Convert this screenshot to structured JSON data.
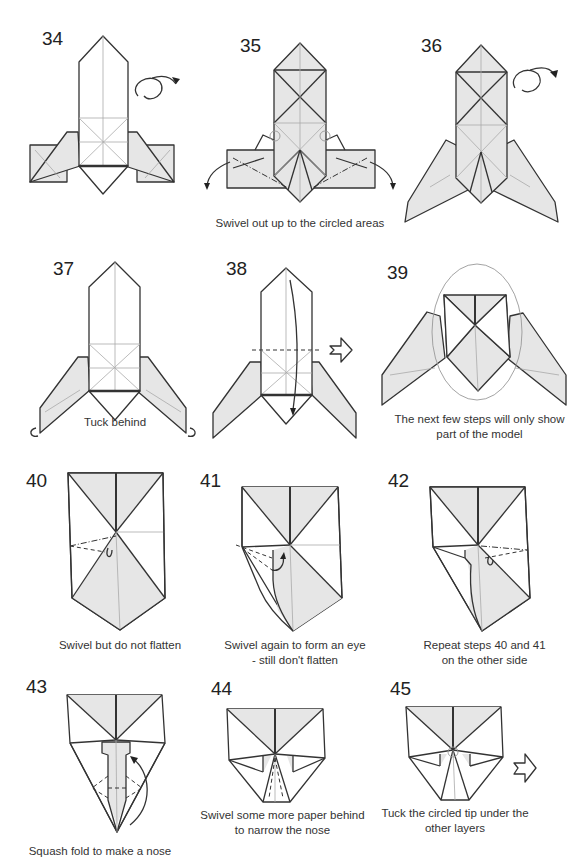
{
  "colors": {
    "line": "#333333",
    "crease": "#aaaaaa",
    "shade": "#e6e6e6",
    "paper": "#ffffff",
    "oval": "#999999"
  },
  "steps": [
    {
      "number": "34",
      "caption": "",
      "icons": [
        "turn-over-icon"
      ]
    },
    {
      "number": "35",
      "caption": "Swivel out up to the circled areas",
      "icons": [
        "swivel-arrow-icon",
        "circle-marker-icon"
      ]
    },
    {
      "number": "36",
      "caption": "",
      "icons": [
        "turn-over-icon"
      ]
    },
    {
      "number": "37",
      "caption": "Tuck behind",
      "icons": [
        "tuck-arrow-icon"
      ]
    },
    {
      "number": "38",
      "caption": "",
      "icons": [
        "fold-arrow-icon",
        "next-step-arrow-icon"
      ]
    },
    {
      "number": "39",
      "caption_line1": "The next few steps will only show",
      "caption_line2": "part of the model",
      "icons": [
        "focus-oval-icon"
      ]
    },
    {
      "number": "40",
      "caption": "Swivel but do not flatten",
      "icons": [
        "swivel-arrow-icon"
      ]
    },
    {
      "number": "41",
      "caption_line1": "Swivel again to form an eye",
      "caption_line2": "- still don't flatten",
      "icons": [
        "swivel-arrow-icon"
      ]
    },
    {
      "number": "42",
      "caption_line1": "Repeat steps 40 and 41",
      "caption_line2": "on the other side",
      "icons": [
        "swivel-arrow-icon"
      ]
    },
    {
      "number": "43",
      "caption": "Squash fold to make a nose",
      "icons": [
        "squash-arrow-icon"
      ]
    },
    {
      "number": "44",
      "caption_line1": "Swivel some more paper behind",
      "caption_line2": "to narrow the nose",
      "icons": []
    },
    {
      "number": "45",
      "caption_line1": "Tuck the circled tip under the",
      "caption_line2": "other layers",
      "icons": [
        "next-step-arrow-icon",
        "circle-marker-icon"
      ]
    }
  ]
}
